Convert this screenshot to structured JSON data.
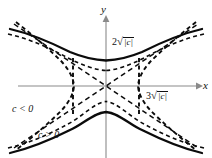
{
  "figure": {
    "name": "hyperbola-level-curves",
    "background_color": "#ffffff",
    "axes": {
      "color": "#8a8a8a",
      "x_label": "x",
      "y_label": "y",
      "origin": {
        "x": 106,
        "y": 86
      },
      "x_extent": [
        18,
        200
      ],
      "y_extent": [
        16,
        158
      ]
    },
    "annotations": {
      "y_intercept": {
        "coefficient": "2",
        "radical_body": "|c|",
        "full_text": "2√|c|",
        "position": {
          "x": 112,
          "y": 38
        }
      },
      "x_intercept": {
        "coefficient": "3",
        "radical_body": "|c|",
        "full_text": "3√|c|",
        "position": {
          "x": 145,
          "y": 92
        }
      },
      "negative_c": {
        "text": "c < 0",
        "position": {
          "x": 12,
          "y": 106
        }
      },
      "positive_c": {
        "text": "c > 0",
        "position": {
          "x": 38,
          "y": 131
        }
      }
    },
    "curves": {
      "solid": {
        "style": "solid",
        "color": "#0b0b0b",
        "description": "vertical-opening hyperbola branches, vertex at 2√|c|"
      },
      "dashed": {
        "style": "dashed",
        "color": "#0b0b0b",
        "description": "horizontal-opening hyperbola branches, vertex at 3√|c|"
      },
      "asymptotes": {
        "style": "dashed",
        "color": "#0b0b0b",
        "description": "diagonal asymptote lines through the origin"
      }
    }
  }
}
